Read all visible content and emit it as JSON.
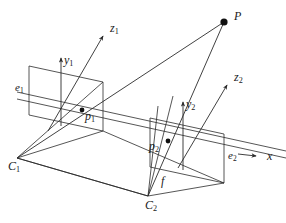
{
  "figure": {
    "domain": "diagram",
    "background_color": "#ffffff",
    "stroke_color": "#2b2b2b",
    "text_color": "#1a1a1a",
    "width": 286,
    "height": 223
  },
  "labels": {
    "point_P": {
      "base": "P",
      "sub": ""
    },
    "axis_z1": {
      "base": "z",
      "sub": "1"
    },
    "axis_y1": {
      "base": "y",
      "sub": "1"
    },
    "axis_z2": {
      "base": "z",
      "sub": "2"
    },
    "axis_y2": {
      "base": "y",
      "sub": "2"
    },
    "axis_x": {
      "base": "x",
      "sub": ""
    },
    "epipole_e1": {
      "base": "e",
      "sub": "1"
    },
    "epipole_e2": {
      "base": "e",
      "sub": "2"
    },
    "image_p1": {
      "base": "p",
      "sub": "1"
    },
    "image_p2": {
      "base": "p",
      "sub": "2"
    },
    "camera_C1": {
      "base": "C",
      "sub": "1"
    },
    "camera_C2": {
      "base": "C",
      "sub": "2"
    },
    "focal_f": {
      "base": "f",
      "sub": ""
    }
  },
  "geometry": {
    "points": {
      "P": {
        "x": 224,
        "y": 22
      },
      "C1": {
        "x": 17,
        "y": 158
      },
      "C2": {
        "x": 148,
        "y": 196
      },
      "p1": {
        "x": 82,
        "y": 110
      },
      "p2": {
        "x": 168,
        "y": 141
      },
      "z1_tip": {
        "x": 104,
        "y": 35
      },
      "z2_tip": {
        "x": 228,
        "y": 84
      },
      "y1_tip": {
        "x": 61,
        "y": 57
      },
      "y2_tip": {
        "x": 183,
        "y": 101
      },
      "x_tip": {
        "x": 254,
        "y": 157
      }
    },
    "image_plane_1": [
      {
        "x": 29,
        "y": 66
      },
      {
        "x": 103,
        "y": 82
      },
      {
        "x": 103,
        "y": 131
      },
      {
        "x": 29,
        "y": 115
      }
    ],
    "image_plane_2": [
      {
        "x": 150,
        "y": 118
      },
      {
        "x": 224,
        "y": 134
      },
      {
        "x": 224,
        "y": 183
      },
      {
        "x": 150,
        "y": 167
      }
    ],
    "baseline": {
      "from": "C1",
      "to": "C2"
    },
    "rays": [
      {
        "name": "ray-C1-to-P",
        "from": "C1",
        "to": "P"
      },
      {
        "name": "ray-C2-to-P",
        "from": "C2",
        "to": "P"
      },
      {
        "name": "baseline-C1-C2",
        "from": "C1",
        "to": "C2"
      }
    ]
  },
  "label_positions": {
    "point_P": {
      "x": 234,
      "y": 10
    },
    "axis_z1": {
      "x": 110,
      "y": 22
    },
    "axis_y1": {
      "x": 64,
      "y": 54
    },
    "axis_z2": {
      "x": 234,
      "y": 71
    },
    "axis_y2": {
      "x": 186,
      "y": 98
    },
    "axis_x": {
      "x": 267,
      "y": 150
    },
    "epipole_e1": {
      "x": 15,
      "y": 82
    },
    "epipole_e2": {
      "x": 228,
      "y": 150
    },
    "image_p1": {
      "x": 85,
      "y": 110
    },
    "image_p2": {
      "x": 149,
      "y": 140
    },
    "camera_C1": {
      "x": 8,
      "y": 160
    },
    "camera_C2": {
      "x": 145,
      "y": 199
    },
    "focal_f": {
      "x": 161,
      "y": 175
    }
  }
}
